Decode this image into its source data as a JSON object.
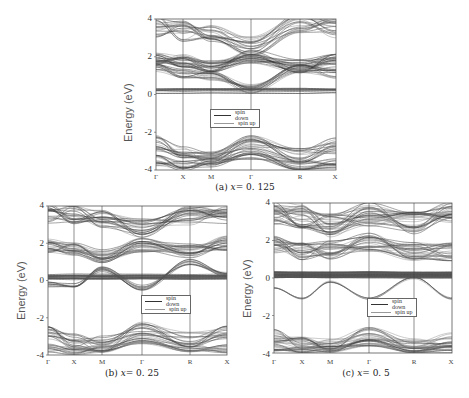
{
  "figure": {
    "y_axis_label": "Energy (eV)",
    "y_ticks": [
      "4",
      "2",
      "0",
      "-2",
      "-4"
    ],
    "x_ticks": [
      "Γ",
      "X",
      "M",
      "Γ",
      "R",
      "X"
    ],
    "legend": {
      "spin_down": "spin down",
      "spin_up": "spin up"
    },
    "panels": [
      {
        "id": "a",
        "caption_prefix": "(a)",
        "caption_var": "x",
        "caption_value": "= 0. 125"
      },
      {
        "id": "b",
        "caption_prefix": "(b)",
        "caption_var": "x",
        "caption_value": "= 0. 25"
      },
      {
        "id": "c",
        "caption_prefix": "(c)",
        "caption_var": "x",
        "caption_value": "= 0. 5"
      }
    ]
  },
  "chart_data": [
    {
      "type": "line",
      "title": "(a) x = 0.125",
      "xlabel": "",
      "ylabel": "Energy (eV)",
      "ylim": [
        -4,
        4
      ],
      "x_high_symmetry_points": [
        "Γ",
        "X",
        "M",
        "Γ",
        "R",
        "X"
      ],
      "y_ticks": [
        4,
        2,
        0,
        -2,
        -4
      ],
      "legend": [
        "spin down",
        "spin up"
      ],
      "legend_position": "center",
      "grid": false,
      "annotations": "Dense bands between ~0 and 4 eV (conduction), band gap from ~0 to ~-2.4 eV, valence bands from ~-2.4 to -4 eV; crossing near R at ~1.5 eV"
    },
    {
      "type": "line",
      "title": "(b) x = 0.25",
      "xlabel": "",
      "ylabel": "Energy (eV)",
      "ylim": [
        -4,
        4
      ],
      "x_high_symmetry_points": [
        "Γ",
        "X",
        "M",
        "Γ",
        "R",
        "X"
      ],
      "y_ticks": [
        4,
        2,
        0,
        -2,
        -4
      ],
      "legend": [
        "spin down",
        "spin up"
      ],
      "legend_position": "center-right",
      "grid": false,
      "annotations": "Flat bands near 0–0.3 eV; band dips to ~-0.4 eV at Γ; valence bands from ~-2.6 to -4 eV"
    },
    {
      "type": "line",
      "title": "(c) x = 0.5",
      "xlabel": "",
      "ylabel": "Energy (eV)",
      "ylim": [
        -4,
        4
      ],
      "x_high_symmetry_points": [
        "Γ",
        "X",
        "M",
        "Γ",
        "R",
        "X"
      ],
      "y_ticks": [
        4,
        2,
        0,
        -2,
        -4
      ],
      "legend": [
        "spin down",
        "spin up"
      ],
      "legend_position": "center-right",
      "grid": false,
      "annotations": "Very dense flat band manifold at 0–0.3 eV; dispersive band reaching ~-1.1 eV at X and Γ; valence bands ~-3 to -4 eV"
    }
  ]
}
